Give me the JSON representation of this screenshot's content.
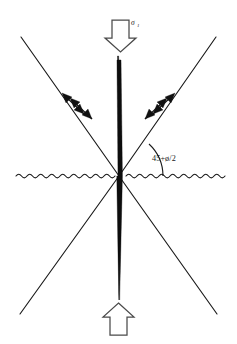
{
  "figure": {
    "background_color": "#ffffff",
    "line_color": "#1a1a1a",
    "spindle_color": "#0d0d0d",
    "arrow_outline_color": "#4a4a4a",
    "arrow_fill_color": "#ffffff",
    "shear_marker_color": "#111111"
  },
  "labels": {
    "angle": "45+ø/2",
    "stress_symbol": "σ",
    "stress_subscript": "1",
    "stress_full": "σ1"
  },
  "elements": {
    "top_arrow_name": "sigma-1 downward load arrow",
    "bottom_arrow_name": "reaction upward arrow",
    "spindle_name": "vertical axial failure spindle",
    "wavy_line_name": "horizontal ground surface wavy line",
    "arc_name": "angle arc between horizontal and failure plane",
    "left_upper_plane": "upper-left failure plane",
    "right_upper_plane": "upper-right failure plane",
    "left_lower_plane": "lower-left failure plane",
    "right_lower_plane": "lower-right failure plane",
    "shear_pair_left": "left shear sense double arrows",
    "shear_pair_right": "right shear sense double arrows"
  },
  "geometry": {
    "center_x": 119,
    "center_y": 176,
    "angle_degrees_text": "45+ø/2",
    "wavy_baseline_y": 176,
    "wavy_amplitude": 3,
    "wavy_wavelength": 11
  }
}
